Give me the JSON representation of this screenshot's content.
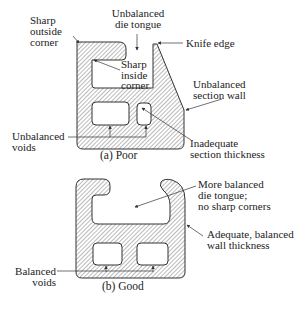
{
  "poor": {
    "caption": "(a)  Poor",
    "labels": {
      "sharp_outside_corner": [
        "Sharp",
        "outside",
        "corner"
      ],
      "unbalanced_die_tongue": [
        "Unbalanced",
        "die tongue"
      ],
      "knife_edge": "Knife edge",
      "sharp_inside_corner": [
        "Sharp",
        "inside",
        "corner"
      ],
      "unbalanced_section_wall": [
        "Unbalanced",
        "section wall"
      ],
      "unbalanced_voids": [
        "Unbalanced",
        "voids"
      ],
      "inadequate_section_thickness": [
        "Inadequate",
        "section thickness"
      ]
    }
  },
  "good": {
    "caption": "(b) Good",
    "labels": {
      "more_balanced_die_tongue": [
        "More balanced",
        "die tongue;",
        "no sharp corners"
      ],
      "adequate_wall_thickness": [
        "Adequate, balanced",
        "wall thickness"
      ],
      "balanced_voids": [
        "Balanced",
        "voids"
      ]
    }
  },
  "colors": {
    "stroke": "#333333",
    "hatch": "#555555",
    "background": "#ffffff"
  }
}
